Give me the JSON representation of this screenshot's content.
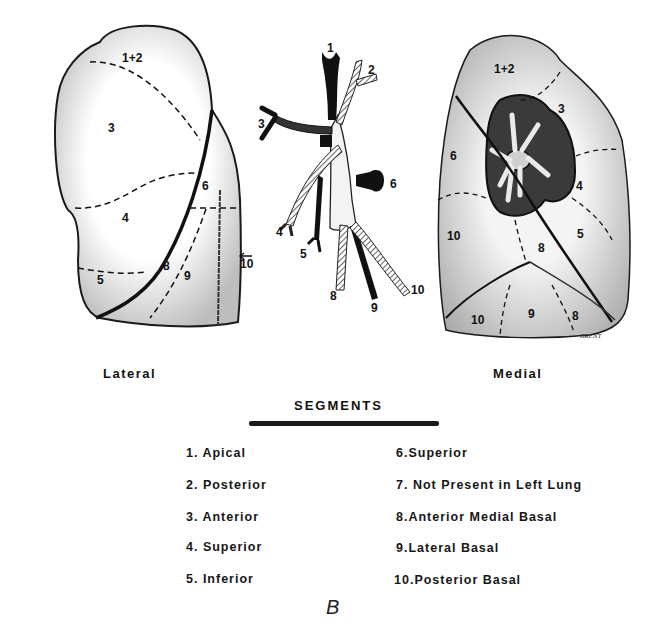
{
  "figure": {
    "letter": "B",
    "views": {
      "lateral": {
        "label": "Lateral",
        "segment_numbers": [
          "1+2",
          "3",
          "4",
          "5",
          "6",
          "8",
          "9",
          "10"
        ]
      },
      "bronchial_tree": {
        "branch_numbers": [
          "1",
          "2",
          "3",
          "4",
          "5",
          "6",
          "8",
          "9",
          "10"
        ]
      },
      "medial": {
        "label": "Medial",
        "segment_numbers": [
          "1+2",
          "3",
          "4",
          "5",
          "6",
          "8",
          "10",
          "9",
          "8",
          "10"
        ],
        "signature": "BRENT"
      }
    }
  },
  "legend": {
    "title": "SEGMENTS",
    "left_column": [
      "1. Apical",
      "2. Posterior",
      "3. Anterior",
      "4. Superior",
      "5. Inferior"
    ],
    "right_column": [
      "6.Superior",
      "7. Not Present in Left Lung",
      "8.Anterior Medial Basal",
      "9.Lateral Basal",
      "10.Posterior Basal"
    ]
  }
}
